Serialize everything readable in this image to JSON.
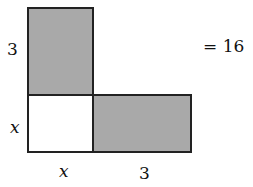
{
  "diagram": {
    "shapes": [
      {
        "id": "top-rect",
        "label_side": "3",
        "shaded": true
      },
      {
        "id": "square",
        "label_side": "x",
        "shaded": false
      },
      {
        "id": "right-rect",
        "label_side": "3",
        "shaded": true
      }
    ],
    "labels": {
      "top_left": "3",
      "mid_left": "x",
      "bottom_left": "x",
      "bottom_right": "3",
      "equation": "= 16"
    },
    "colors": {
      "shade": "#a9a9a9",
      "stroke": "#222222"
    }
  }
}
